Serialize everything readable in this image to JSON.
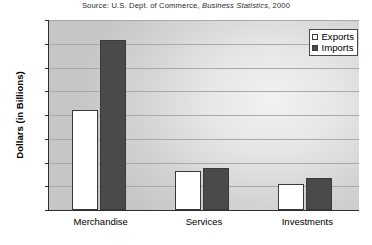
{
  "source_note": {
    "prefix": "Source: U.S. Dept. of Commerce, ",
    "italic": "Business Statistics",
    "suffix": ", 2000"
  },
  "legend": {
    "position": "top-right",
    "entries": [
      {
        "label": "Exports",
        "swatch": "exports-swatch-icon",
        "color": "#ffffff"
      },
      {
        "label": "Imports",
        "swatch": "imports-swatch-icon",
        "color": "#4a4a4a"
      }
    ]
  },
  "chart_data": {
    "type": "bar",
    "title": "",
    "subtitle": "",
    "xlabel": "",
    "ylabel": "Dollars (in Billions)",
    "categories": [
      "Merchandise",
      "Services",
      "Investments"
    ],
    "series": [
      {
        "name": "Exports",
        "color": "#ffffff",
        "values": [
          420,
          165,
          110
        ]
      },
      {
        "name": "Imports",
        "color": "#4a4a4a",
        "values": [
          715,
          175,
          135
        ]
      }
    ],
    "ylim": [
      0,
      800
    ],
    "ytick_labels": [
      "0",
      "100",
      "200",
      "300",
      "400",
      "500",
      "600",
      "700",
      "800"
    ],
    "ytick_values": [
      0,
      100,
      200,
      300,
      400,
      500,
      600,
      700,
      800
    ],
    "grid": "horizontal",
    "legend_position": "top-right",
    "axis_colors": {
      "axis": "#2f2f2f",
      "grid": "#a9a9a9"
    }
  }
}
